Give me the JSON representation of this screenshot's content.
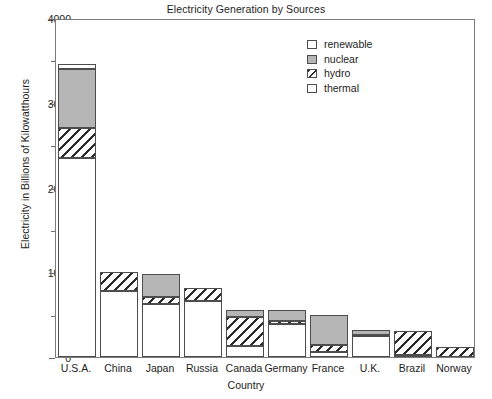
{
  "chart_data": {
    "type": "bar",
    "title": "Electricity Generation by Sources",
    "xlabel": "Country",
    "ylabel": "Electricity in Billions of Kilowatthours",
    "stacked": true,
    "grid": false,
    "legend_position": "top-right",
    "ylim": [
      0,
      4000
    ],
    "yticks": [
      0,
      1000,
      2000,
      3000,
      4000
    ],
    "ytick_labels": [
      "0",
      "1000",
      "2000",
      "3000",
      "4000"
    ],
    "yminor_ticks": [
      500,
      1500,
      2500,
      3500
    ],
    "categories": [
      "U.S.A.",
      "China",
      "Japan",
      "Russia",
      "Canada",
      "Germany",
      "France",
      "U.K.",
      "Brazil",
      "Norway"
    ],
    "series": [
      {
        "name": "thermal",
        "color": "#ffffff",
        "pattern": "solid",
        "values": [
          2350,
          780,
          620,
          660,
          130,
          390,
          60,
          250,
          20,
          0
        ]
      },
      {
        "name": "hydro",
        "color": "#ffffff",
        "pattern": "hatch",
        "values": [
          350,
          225,
          90,
          160,
          340,
          30,
          80,
          10,
          290,
          120
        ]
      },
      {
        "name": "nuclear",
        "color": "#b6b6b6",
        "pattern": "solid",
        "values": [
          700,
          0,
          265,
          0,
          90,
          130,
          360,
          55,
          0,
          0
        ]
      },
      {
        "name": "renewable",
        "color": "#ffffff",
        "pattern": "solid",
        "values": [
          60,
          0,
          0,
          0,
          0,
          0,
          0,
          0,
          0,
          0
        ]
      }
    ],
    "totals": [
      3460,
      1005,
      975,
      820,
      560,
      550,
      500,
      315,
      310,
      120
    ]
  },
  "legend": {
    "entries": [
      {
        "label": "renewable",
        "swatch": "renewable"
      },
      {
        "label": "nuclear",
        "swatch": "nuclear"
      },
      {
        "label": "hydro",
        "swatch": "hydro"
      },
      {
        "label": "thermal",
        "swatch": "thermal"
      }
    ]
  }
}
